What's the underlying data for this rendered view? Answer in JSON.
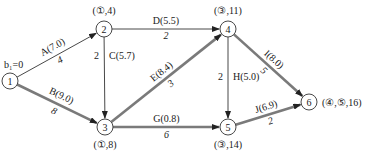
{
  "diagram": {
    "type": "network-critical-path",
    "start_label": "b₁=0",
    "colors": {
      "normal_edge": "#333333",
      "critical_edge": "#7a7a7a",
      "node_stroke": "#333333",
      "text": "#1a1a1a"
    },
    "nodes": [
      {
        "id": "1",
        "label": "1",
        "mark": ""
      },
      {
        "id": "2",
        "label": "2",
        "mark": "(①,4)"
      },
      {
        "id": "3",
        "label": "3",
        "mark": "(①,8)"
      },
      {
        "id": "4",
        "label": "4",
        "mark": "(③,11)"
      },
      {
        "id": "5",
        "label": "5",
        "mark": "(③,14)"
      },
      {
        "id": "6",
        "label": "6",
        "mark": "(④,⑤,16)"
      }
    ],
    "edges": [
      {
        "id": "A",
        "from": "1",
        "to": "2",
        "label": "A(7.0)",
        "weight": "4",
        "critical": false
      },
      {
        "id": "B",
        "from": "1",
        "to": "3",
        "label": "B(9.0)",
        "weight": "8",
        "critical": true
      },
      {
        "id": "C",
        "from": "2",
        "to": "3",
        "label": "C(5.7)",
        "weight": "2",
        "critical": false
      },
      {
        "id": "D",
        "from": "2",
        "to": "4",
        "label": "D(5.5)",
        "weight": "2",
        "critical": false
      },
      {
        "id": "E",
        "from": "3",
        "to": "4",
        "label": "E(8.4)",
        "weight": "3",
        "critical": true
      },
      {
        "id": "G",
        "from": "3",
        "to": "5",
        "label": "G(0.8)",
        "weight": "6",
        "critical": true
      },
      {
        "id": "H",
        "from": "4",
        "to": "5",
        "label": "H(5.0)",
        "weight": "2",
        "critical": false
      },
      {
        "id": "I",
        "from": "4",
        "to": "6",
        "label": "I(8.0)",
        "weight": "5",
        "critical": true
      },
      {
        "id": "J",
        "from": "5",
        "to": "6",
        "label": "J(6.9)",
        "weight": "2",
        "critical": true
      }
    ]
  }
}
